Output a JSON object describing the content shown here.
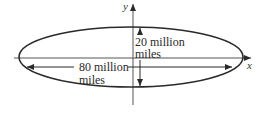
{
  "diagram": {
    "type": "ellipse-orbit",
    "axes": {
      "x_label": "x",
      "y_label": "y"
    },
    "dimensions": {
      "vertical": {
        "line1": "20 million",
        "line2": "miles"
      },
      "horizontal": {
        "line1": "80 million",
        "line2": "miles"
      }
    },
    "colors": {
      "stroke": "#2a2a2a",
      "axis": "#555555",
      "background": "#ffffff"
    }
  }
}
